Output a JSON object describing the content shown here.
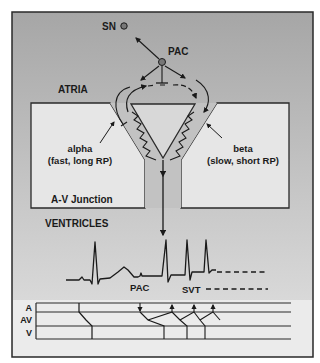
{
  "figure": {
    "labels": {
      "sn": "SN",
      "pac_top": "PAC",
      "atria": "ATRIA",
      "alpha_line1": "alpha",
      "alpha_line2": "(fast, long RP)",
      "beta_line1": "beta",
      "beta_line2": "(slow, short RP)",
      "av_junction": "A-V Junction",
      "ventricles": "VENTRICLES",
      "pac_ecg": "PAC",
      "svt": "SVT"
    },
    "ladder": {
      "rows": [
        "A",
        "AV",
        "V"
      ]
    },
    "colors": {
      "frame": "#2a2a2a",
      "background_top": "#a9a9a9",
      "background_bottom": "#e4e4e4",
      "pathway": "#c4c4c4",
      "box_fill": "#e6e6e6",
      "ink": "#1a1a1a"
    }
  }
}
